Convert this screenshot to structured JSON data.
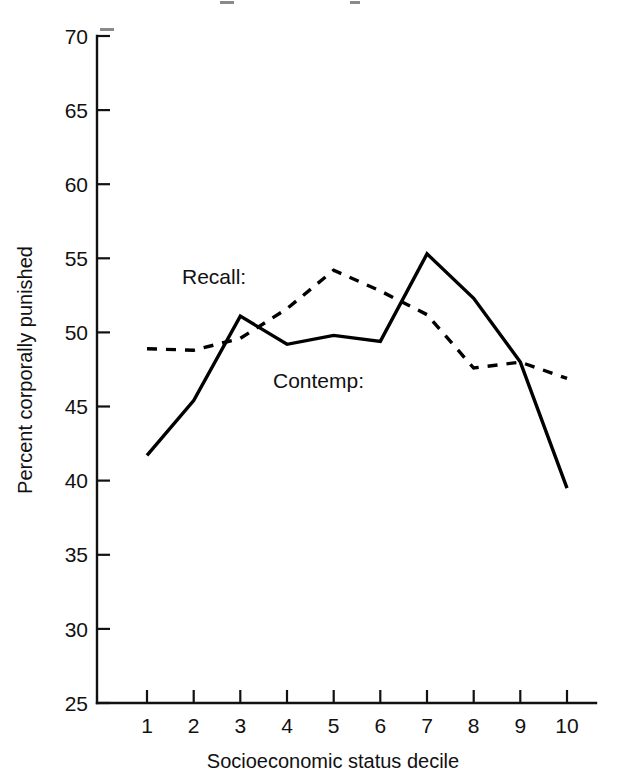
{
  "chart_data": {
    "type": "line",
    "title": "",
    "xlabel": "Socioeconomic status decile",
    "ylabel": "Percent corporally punished",
    "categories": [
      1,
      2,
      3,
      4,
      5,
      6,
      7,
      8,
      9,
      10
    ],
    "xtick_labels": [
      "1",
      "2",
      "3",
      "4",
      "5",
      "6",
      "7",
      "8",
      "9",
      "10"
    ],
    "ytick_labels": [
      "25",
      "30",
      "35",
      "40",
      "45",
      "50",
      "55",
      "60",
      "65",
      "70"
    ],
    "ytick_values": [
      25,
      30,
      35,
      40,
      45,
      50,
      55,
      60,
      65,
      70
    ],
    "xlim": [
      0.5,
      10.5
    ],
    "ylim": [
      25,
      70
    ],
    "grid": false,
    "legend_position": "inline-annotations",
    "series": [
      {
        "name": "Recall:",
        "style": "dashed",
        "color": "#000000",
        "values": [
          48.9,
          48.8,
          49.6,
          51.6,
          54.2,
          52.8,
          51.2,
          47.6,
          48.0,
          46.9
        ]
      },
      {
        "name": "Contemp:",
        "style": "solid",
        "color": "#000000",
        "values": [
          41.7,
          45.4,
          51.1,
          49.2,
          49.8,
          49.4,
          55.3,
          52.3,
          48.0,
          39.5
        ]
      }
    ],
    "annotations": [
      {
        "text": "Recall:",
        "x_px": 182,
        "y_px": 277
      },
      {
        "text": "Contemp:",
        "x_px": 273,
        "y_px": 381
      }
    ]
  },
  "axes": {
    "y_axis_title": "Percent corporally punished",
    "x_axis_title": "Socioeconomic status decile"
  }
}
